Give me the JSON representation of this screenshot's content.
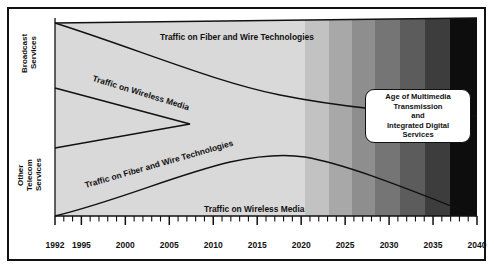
{
  "figure": {
    "y_axis": {
      "top_label": "Broadcast\nServices",
      "bottom_label": "Other\nTelecom\nServices"
    },
    "x_axis": {
      "ticks": [
        "1992",
        "1995",
        "2000",
        "2005",
        "2010",
        "2015",
        "2020",
        "2025",
        "2030",
        "2035",
        "2040"
      ],
      "min": 1992,
      "max": 2040,
      "minor_tick_interval": 1,
      "major_tick_interval": 5
    },
    "band_labels": [
      {
        "id": "broadcast-fiber",
        "text": "Traffic on Fiber and Wire Technologies",
        "x": 160,
        "y": 32,
        "rotate": 0
      },
      {
        "id": "broadcast-wireless",
        "text": "Traffic on Wireless Media",
        "x": 93,
        "y": 73,
        "rotate": 17
      },
      {
        "id": "telecom-fiber",
        "text": "Traffic on Fiber and Wire Technologies",
        "x": 85,
        "y": 180,
        "rotate": -16
      },
      {
        "id": "telecom-wireless",
        "text": "Traffic on Wireless Media",
        "x": 204,
        "y": 204,
        "rotate": 0
      }
    ],
    "callout": {
      "text": "Age of Multimedia\nTransmission\nand\nIntegrated Digital\nServices"
    },
    "shading": {
      "base_color": "#d9d9d9",
      "bands": [
        {
          "x": 55,
          "w": 250,
          "color": "#d9d9d9"
        },
        {
          "x": 305,
          "w": 24,
          "color": "#c2c2c2"
        },
        {
          "x": 329,
          "w": 23,
          "color": "#a8a8a8"
        },
        {
          "x": 352,
          "w": 23,
          "color": "#8e8e8e"
        },
        {
          "x": 375,
          "w": 25,
          "color": "#757575"
        },
        {
          "x": 400,
          "w": 25,
          "color": "#5c5c5c"
        },
        {
          "x": 425,
          "w": 25,
          "color": "#3d3d3d"
        },
        {
          "x": 450,
          "w": 27,
          "color": "#0d0d0d"
        }
      ]
    },
    "curves": {
      "broadcast_divider": "Traffic on Fiber and Wire Technologies / Traffic on Wireless Media boundary in broadcast band",
      "telecom_divider": "Traffic on Fiber and Wire Technologies / Traffic on Wireless Media boundary in telecom band",
      "middle_wedge": "Converging wedge separating broadcast and telecom services"
    },
    "colors": {
      "stroke": "#111111",
      "background": "#ffffff",
      "frame": "#111111"
    }
  }
}
